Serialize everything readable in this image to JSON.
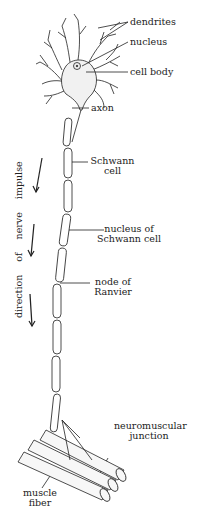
{
  "diagram": {
    "labels": {
      "dendrites": "dendrites",
      "nucleus": "nucleus",
      "cell_body": "cell body",
      "axon": "axon",
      "schwann_cell_1": "Schwann",
      "schwann_cell_2": "cell",
      "nucleus_schwann_1": "nucleus of",
      "nucleus_schwann_2": "Schwann cell",
      "node_ranvier_1": "node of",
      "node_ranvier_2": "Ranvier",
      "nmj_1": "neuromuscular",
      "nmj_2": "junction",
      "muscle_1": "muscle",
      "muscle_2": "fiber",
      "direction": "direction of nerve impulse"
    },
    "colors": {
      "line": "#222222",
      "label": "#222222",
      "background": "#ffffff"
    }
  }
}
